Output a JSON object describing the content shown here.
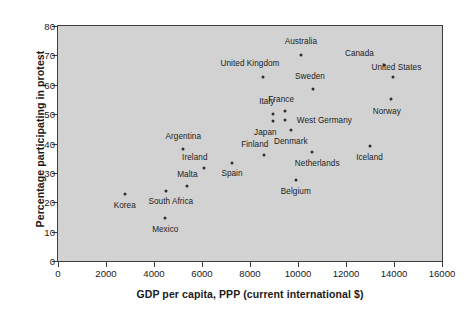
{
  "chart_data": {
    "type": "scatter",
    "title": "",
    "xlabel": "GDP per capita, PPP (current international $)",
    "ylabel": "Percentage participating in protest",
    "xlim": [
      0,
      16000
    ],
    "ylim": [
      0,
      80
    ],
    "xticks": [
      0,
      2000,
      4000,
      6000,
      8000,
      10000,
      12000,
      14000,
      16000
    ],
    "yticks": [
      0,
      10,
      20,
      30,
      40,
      50,
      60,
      70,
      80
    ],
    "xtick_labels": [
      "0",
      "2000",
      "4000",
      "6000",
      "8000",
      "10000",
      "12000",
      "14000",
      "16000"
    ],
    "ytick_labels": [
      "0",
      "10",
      "20",
      "30",
      "40",
      "50",
      "60",
      "70",
      "80"
    ],
    "grid": false,
    "legend": "none",
    "plot_background": "#d2d2d2",
    "marker_color": "#2e2e2e",
    "points": [
      {
        "label": "Australia",
        "x": 10120,
        "y": 70.0,
        "lx": 10120,
        "ly": 75.0,
        "lpos": "above"
      },
      {
        "label": "United Kingdom",
        "x": 8540,
        "y": 62.8,
        "lx": 8000,
        "ly": 67.5,
        "lpos": "above"
      },
      {
        "label": "Canada",
        "x": 13600,
        "y": 66.6,
        "lx": 12560,
        "ly": 70.9,
        "lpos": "above"
      },
      {
        "label": "United States",
        "x": 13940,
        "y": 62.5,
        "lx": 14100,
        "ly": 66.2,
        "lpos": "above"
      },
      {
        "label": "Sweden",
        "x": 10620,
        "y": 58.4,
        "lx": 10500,
        "ly": 63.0,
        "lpos": "above"
      },
      {
        "label": "Norway",
        "x": 13890,
        "y": 55.0,
        "lx": 13700,
        "ly": 51.0,
        "lpos": "below"
      },
      {
        "label": "France",
        "x": 9450,
        "y": 51.0,
        "lx": 9300,
        "ly": 55.2,
        "lpos": "above"
      },
      {
        "label": "Italy",
        "x": 8960,
        "y": 50.0,
        "lx": 8700,
        "ly": 54.5,
        "lpos": "above"
      },
      {
        "label": "West Germany",
        "x": 9450,
        "y": 47.9,
        "lx": 11100,
        "ly": 47.9,
        "lpos": "right"
      },
      {
        "label": "Japan",
        "x": 8960,
        "y": 47.6,
        "lx": 8640,
        "ly": 44.0,
        "lpos": "below"
      },
      {
        "label": "Denmark",
        "x": 9700,
        "y": 44.5,
        "lx": 9700,
        "ly": 41.0,
        "lpos": "below"
      },
      {
        "label": "Netherlands",
        "x": 10570,
        "y": 37.1,
        "lx": 10800,
        "ly": 33.5,
        "lpos": "below"
      },
      {
        "label": "Iceland",
        "x": 12980,
        "y": 39.2,
        "lx": 12980,
        "ly": 35.3,
        "lpos": "below"
      },
      {
        "label": "Finland",
        "x": 8580,
        "y": 36.2,
        "lx": 8200,
        "ly": 39.8,
        "lpos": "above"
      },
      {
        "label": "Argentina",
        "x": 5220,
        "y": 38.2,
        "lx": 5220,
        "ly": 42.6,
        "lpos": "above"
      },
      {
        "label": "Spain",
        "x": 7250,
        "y": 33.4,
        "lx": 7250,
        "ly": 29.9,
        "lpos": "below"
      },
      {
        "label": "Ireland",
        "x": 6100,
        "y": 31.8,
        "lx": 5700,
        "ly": 35.3,
        "lpos": "above"
      },
      {
        "label": "Malta",
        "x": 5390,
        "y": 25.7,
        "lx": 5390,
        "ly": 29.5,
        "lpos": "above"
      },
      {
        "label": "Belgium",
        "x": 9910,
        "y": 27.7,
        "lx": 9910,
        "ly": 24.0,
        "lpos": "below"
      },
      {
        "label": "South Africa",
        "x": 4520,
        "y": 24.0,
        "lx": 4700,
        "ly": 20.5,
        "lpos": "below"
      },
      {
        "label": "Korea",
        "x": 2780,
        "y": 22.9,
        "lx": 2780,
        "ly": 19.0,
        "lpos": "below"
      },
      {
        "label": "Mexico",
        "x": 4470,
        "y": 14.5,
        "lx": 4470,
        "ly": 11.0,
        "lpos": "below"
      }
    ]
  }
}
